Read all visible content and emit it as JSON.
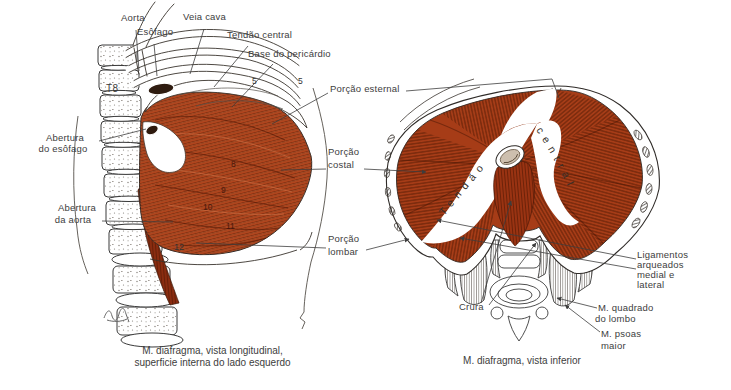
{
  "colors": {
    "muscle_base": "#b0451e",
    "muscle_cap": "#a63d18",
    "muscle_dark": "#5a1c06",
    "muscle_light": "#d97c4a",
    "outline": "#2f2b28",
    "label_text": "#3d3d3d",
    "background": "#ffffff"
  },
  "left": {
    "caption1": "M. diafragma, vista longitudinal,",
    "caption2": "superficie interna do lado esquerdo",
    "aorta": "Aorta",
    "esofago": "Esôfago",
    "veia_cava": "Veia cava",
    "tendao_central": "Tendão central",
    "base_pericardio": "Base do pericárdio",
    "abertura_esofago1": "Abertura",
    "abertura_esofago2": "do esôfago",
    "abertura_aorta1": "Abertura",
    "abertura_aorta2": "da aorta",
    "t8": "T8",
    "n5a": "5",
    "n5b": "5",
    "n8": "8",
    "n9": "9",
    "n10": "10",
    "n11": "11",
    "n12": "12"
  },
  "middle": {
    "esternal": "Porção esternal",
    "costal1": "Porção",
    "costal2": "costal",
    "lombar1": "Porção",
    "lombar2": "lombar"
  },
  "right": {
    "caption": "M. diafragma, vista inferior",
    "tendao": "Tendão",
    "central": "central",
    "crura": "Crura",
    "lig1": "Ligamentos",
    "lig2": "arqueados",
    "lig3": "medial e",
    "lig4": "lateral",
    "quad1": "M. quadrado",
    "quad2": "do lombo",
    "psoas1": "M. psoas",
    "psoas2": "maior"
  }
}
